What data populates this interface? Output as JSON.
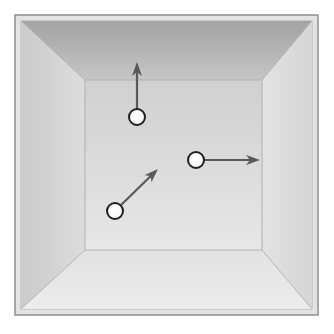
{
  "figure": {
    "name": "perspective-box-with-particles",
    "canvas": {
      "width": 334,
      "height": 334,
      "background": "#ffffff"
    }
  },
  "frame": {
    "outer_rect": {
      "x": 15,
      "y": 15,
      "width": 303,
      "height": 300
    },
    "border_color": "#8f8f8f",
    "border_width": 1.5,
    "fill_color": "#dcdcdc",
    "inset_rect": {
      "x": 21,
      "y": 21,
      "width": 291,
      "height": 288
    },
    "inset_border_color": "#b4b4b4"
  },
  "room": {
    "back_wall": {
      "label": "back-wall",
      "x": 85,
      "y": 80,
      "width": 177,
      "height": 170,
      "fill_top": "#d2d2d2",
      "fill_bottom": "#e6e6e6",
      "edge_color": "#b0b0b0"
    },
    "walls": [
      {
        "label": "ceiling-wall",
        "points": "21,21 312,21 262,80 85,80",
        "fill": "#a8a8a8",
        "fill_far": "#c4c4c4"
      },
      {
        "label": "left-wall",
        "points": "21,21 85,80 85,250 21,309",
        "fill": "#cfcfcf",
        "fill_far": "#dadada"
      },
      {
        "label": "right-wall",
        "points": "312,21 312,309 262,250 262,80",
        "fill": "#d8d8d8",
        "fill_far": "#e0e0e0"
      },
      {
        "label": "floor-wall",
        "points": "21,309 85,250 262,250 312,309",
        "fill": "#e8e8e8",
        "fill_far": "#efefef"
      }
    ],
    "corner_edges": [
      {
        "label": "edge-top-left",
        "x1": 21,
        "y1": 21,
        "x2": 85,
        "y2": 80
      },
      {
        "label": "edge-top-right",
        "x1": 312,
        "y1": 21,
        "x2": 262,
        "y2": 80
      },
      {
        "label": "edge-bottom-left",
        "x1": 21,
        "y1": 309,
        "x2": 85,
        "y2": 250
      },
      {
        "label": "edge-bottom-right",
        "x1": 312,
        "y1": 309,
        "x2": 262,
        "y2": 250
      }
    ],
    "edge_color": "#b5b5b5",
    "edge_width": 1
  },
  "particles": [
    {
      "id": "particle-1",
      "label": "particle-upward",
      "cx": 137,
      "cy": 117,
      "r": 8,
      "fill": "#fbfbfb",
      "stroke": "#1f1f1f",
      "stroke_width": 2,
      "vector": {
        "label": "velocity-vector-up",
        "x1": 137,
        "y1": 110,
        "x2": 137,
        "y2": 62,
        "dx": 0,
        "dy": -48,
        "direction": "up",
        "color": "#595959",
        "width": 2.2,
        "head_length": 14,
        "head_width": 10
      }
    },
    {
      "id": "particle-2",
      "label": "particle-rightward",
      "cx": 196,
      "cy": 160,
      "r": 8,
      "fill": "#fbfbfb",
      "stroke": "#1f1f1f",
      "stroke_width": 2,
      "vector": {
        "label": "velocity-vector-right",
        "x1": 204,
        "y1": 160,
        "x2": 260,
        "y2": 160,
        "dx": 56,
        "dy": 0,
        "direction": "right",
        "color": "#595959",
        "width": 2.2,
        "head_length": 14,
        "head_width": 10
      }
    },
    {
      "id": "particle-3",
      "label": "particle-diagonal",
      "cx": 115,
      "cy": 211,
      "r": 8,
      "fill": "#fbfbfb",
      "stroke": "#1f1f1f",
      "stroke_width": 2,
      "vector": {
        "label": "velocity-vector-diagonal-up-right",
        "x1": 121,
        "y1": 205,
        "x2": 158,
        "y2": 169,
        "dx": 37,
        "dy": -36,
        "direction": "up-right",
        "color": "#595959",
        "width": 2.2,
        "head_length": 14,
        "head_width": 10
      }
    }
  ],
  "colors": {
    "particle_fill": "#fbfbfb",
    "particle_stroke": "#1f1f1f",
    "arrow": "#595959",
    "wall_dark": "#a8a8a8",
    "wall_light": "#e8e8e8",
    "frame_border": "#8f8f8f"
  }
}
